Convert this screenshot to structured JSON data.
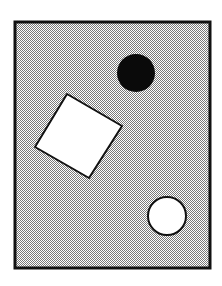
{
  "canvas": {
    "width": 222,
    "height": 286,
    "background": "#ffffff"
  },
  "frame": {
    "x": 15,
    "y": 22,
    "width": 195,
    "height": 246,
    "fill_light": "#ffffff",
    "fill_dark": "#7a7a7a",
    "stroke": "#111111",
    "stroke_width": 3
  },
  "shapes": {
    "black_circle": {
      "cx": 136,
      "cy": 73,
      "r": 19,
      "fill": "#0a0a0a"
    },
    "white_square": {
      "points": "67,94 122,126 89,178 35,147",
      "fill": "#ffffff",
      "stroke": "#111111",
      "stroke_width": 2
    },
    "white_circle": {
      "cx": 167,
      "cy": 216,
      "r": 19,
      "fill": "#ffffff",
      "stroke": "#111111",
      "stroke_width": 2
    }
  }
}
